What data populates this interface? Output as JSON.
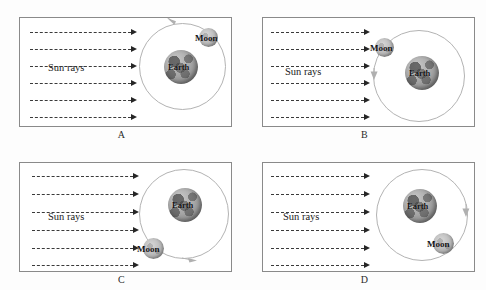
{
  "figure": {
    "background_color": "#fdfdfd",
    "panel_border_color": "#8a8a8a",
    "orbit_color": "#b3b3b3",
    "ray_color": "#3a3a3a",
    "earth_color": "#9d9d9d",
    "moon_color": "#b4b4b4"
  },
  "labels": {
    "sun_rays": "Sun rays",
    "earth": "Earth",
    "moon": "Moon"
  },
  "panels": [
    {
      "id": "A",
      "label": "A",
      "sun_rays_label": "Sun rays",
      "earth_label": "Earth",
      "moon_label": "Moon",
      "ray_count": 6,
      "moon_position": "upper-right",
      "orbit_direction": "counterclockwise",
      "orbit_arrow_position": "top"
    },
    {
      "id": "B",
      "label": "B",
      "sun_rays_label": "Sun rays",
      "earth_label": "Earth",
      "moon_label": "Moon",
      "ray_count": 6,
      "moon_position": "upper-left",
      "orbit_direction": "counterclockwise",
      "orbit_arrow_position": "left"
    },
    {
      "id": "C",
      "label": "C",
      "sun_rays_label": "Sun rays",
      "earth_label": "Earth",
      "moon_label": "Moon",
      "ray_count": 6,
      "moon_position": "lower-left",
      "orbit_direction": "counterclockwise",
      "orbit_arrow_position": "bottom"
    },
    {
      "id": "D",
      "label": "D",
      "sun_rays_label": "Sun rays",
      "earth_label": "Earth",
      "moon_label": "Moon",
      "ray_count": 6,
      "moon_position": "lower-right",
      "orbit_direction": "counterclockwise",
      "orbit_arrow_position": "right"
    }
  ]
}
